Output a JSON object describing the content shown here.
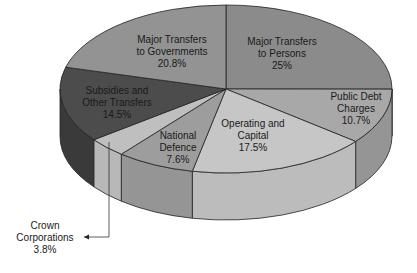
{
  "chart_data": {
    "type": "pie",
    "style": "3d-pie",
    "title": "",
    "slices": [
      {
        "label": "Major Transfers to Persons",
        "lines": [
          "Major Transfers",
          "to Persons",
          "25%"
        ],
        "value": 25.0,
        "top": "#8b8b8b",
        "side": "#7a7a7a",
        "tx": 282,
        "ty": 45
      },
      {
        "label": "Public Debt Charges",
        "lines": [
          "Public Debt",
          "Charges",
          "10.7%"
        ],
        "value": 10.7,
        "top": "#a8a8a8",
        "side": "#959595",
        "tx": 356,
        "ty": 100
      },
      {
        "label": "Operating and Capital",
        "lines": [
          "Operating and",
          "Capital",
          "17.5%"
        ],
        "value": 17.5,
        "top": "#c6c6c6",
        "side": "#bcbcbc",
        "tx": 253,
        "ty": 127
      },
      {
        "label": "National Defence",
        "lines": [
          "National",
          "Defence",
          "7.6%"
        ],
        "value": 7.6,
        "top": "#9d9d9d",
        "side": "#959595",
        "tx": 178,
        "ty": 139
      },
      {
        "label": "Crown Corporations",
        "lines": [
          "Crown",
          "Corporations",
          "3.8%"
        ],
        "value": 3.8,
        "top": "#bfbfbf",
        "side": "#b8b8b8",
        "tx": 45,
        "ty": 229,
        "callout": true
      },
      {
        "label": "Subsidies and Other Transfers",
        "lines": [
          "Subsidies and",
          "Other Transfers",
          "14.5%"
        ],
        "value": 14.5,
        "top": "#4c4c4c",
        "side": "#3a3a3a",
        "tx": 117,
        "ty": 94
      },
      {
        "label": "Major Transfers to Governments",
        "lines": [
          "Major Transfers",
          "to Governments",
          "20.8%"
        ],
        "value": 20.8,
        "top": "#939393",
        "side": "#808080",
        "tx": 172,
        "ty": 43
      }
    ],
    "geometry": {
      "cx": 226,
      "cy": 89,
      "rx": 166,
      "ry": 84,
      "depth": 47,
      "start_angle_deg": 0
    },
    "callout": {
      "from": [
        109,
        142
      ],
      "elbow": [
        109,
        237
      ],
      "to": [
        84,
        237
      ]
    }
  }
}
